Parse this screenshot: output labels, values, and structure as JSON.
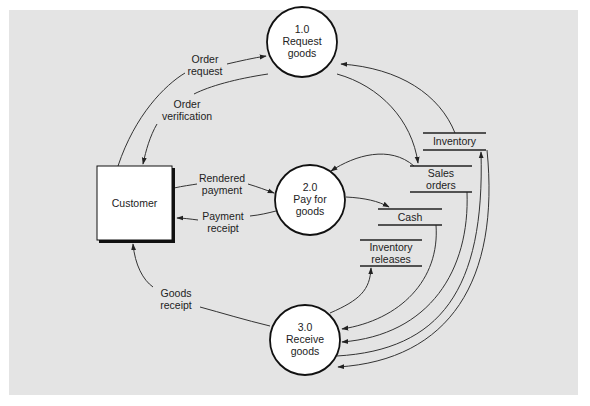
{
  "diagram": {
    "type": "data-flow-diagram",
    "external_entities": [
      {
        "id": "customer",
        "label": "Customer"
      }
    ],
    "processes": [
      {
        "id": "p1",
        "number": "1.0",
        "name_line1": "Request",
        "name_line2": "goods"
      },
      {
        "id": "p2",
        "number": "2.0",
        "name_line1": "Pay for",
        "name_line2": "goods"
      },
      {
        "id": "p3",
        "number": "3.0",
        "name_line1": "Receive",
        "name_line2": "goods"
      }
    ],
    "data_stores": [
      {
        "id": "inventory",
        "line1": "Inventory",
        "line2": ""
      },
      {
        "id": "sales_orders",
        "line1": "Sales",
        "line2": "orders"
      },
      {
        "id": "cash",
        "line1": "Cash",
        "line2": ""
      },
      {
        "id": "inventory_releases",
        "line1": "Inventory",
        "line2": "releases"
      }
    ],
    "flows": [
      {
        "from": "customer",
        "to": "p1",
        "line1": "Order",
        "line2": "request"
      },
      {
        "from": "p1",
        "to": "customer",
        "line1": "Order",
        "line2": "verification"
      },
      {
        "from": "customer",
        "to": "p2",
        "line1": "Rendered",
        "line2": "payment"
      },
      {
        "from": "p2",
        "to": "customer",
        "line1": "Payment",
        "line2": "receipt"
      },
      {
        "from": "p3",
        "to": "customer",
        "line1": "Goods",
        "line2": "receipt"
      },
      {
        "from": "inventory",
        "to": "p1",
        "line1": "",
        "line2": ""
      },
      {
        "from": "p1",
        "to": "sales_orders",
        "line1": "",
        "line2": ""
      },
      {
        "from": "sales_orders",
        "to": "p2",
        "line1": "",
        "line2": ""
      },
      {
        "from": "p2",
        "to": "cash",
        "line1": "",
        "line2": ""
      },
      {
        "from": "p3",
        "to": "inventory_releases",
        "line1": "",
        "line2": ""
      },
      {
        "from": "cash",
        "to": "p3",
        "line1": "",
        "line2": ""
      },
      {
        "from": "sales_orders",
        "to": "p3",
        "line1": "",
        "line2": ""
      },
      {
        "from": "p3",
        "to": "inventory",
        "line1": "",
        "line2": ""
      },
      {
        "from": "inventory",
        "to": "p3",
        "line1": "",
        "line2": ""
      }
    ]
  },
  "colors": {
    "panel_bg": "#e4e4e4",
    "node_fill": "#ffffff",
    "stroke": "#222222"
  }
}
